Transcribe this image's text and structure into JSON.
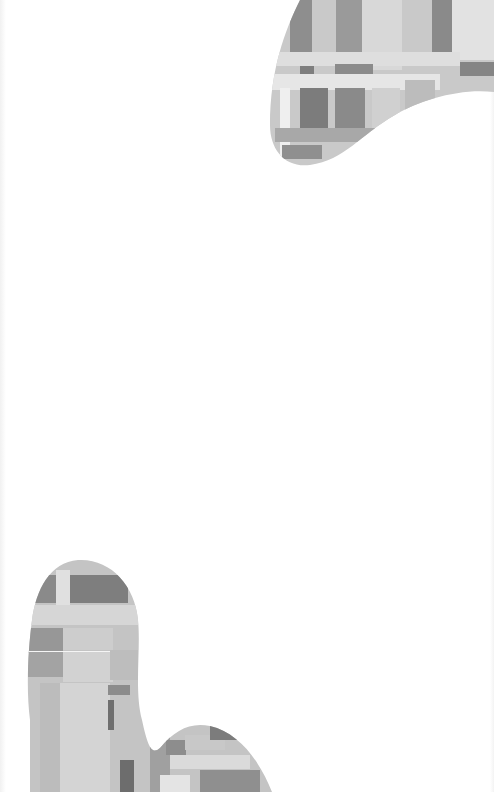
{
  "page": {
    "width": 494,
    "height": 792,
    "background": "#ffffff"
  },
  "decorations": {
    "top_right_blob": {
      "icon": "abstract-blob-shape",
      "fill_style": "grayscale-painterly-rectangles",
      "colors": [
        "#c8c8c8",
        "#9e9e9e",
        "#7a7a7a",
        "#dcdcdc",
        "#b4b4b4"
      ]
    },
    "bottom_left_blob": {
      "icon": "abstract-blob-shape",
      "fill_style": "grayscale-painterly-rectangles",
      "colors": [
        "#c8c8c8",
        "#9e9e9e",
        "#7a7a7a",
        "#dcdcdc",
        "#b4b4b4"
      ]
    }
  }
}
